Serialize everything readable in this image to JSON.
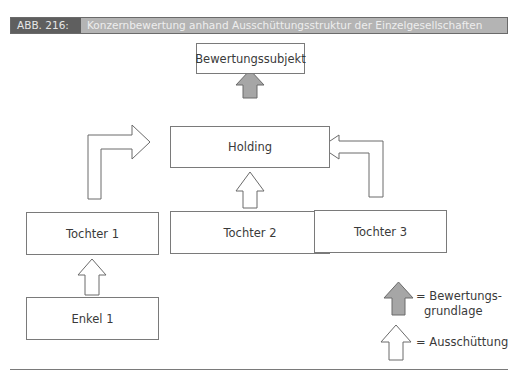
{
  "header": {
    "figure_number": "ABB. 216:",
    "title": "Konzernbewertung anhand Ausschüttungsstruktur der Einzelgesellschaften"
  },
  "nodes": {
    "subject": "Bewertungssubjekt",
    "holding": "Holding",
    "daughter1": "Tochter 1",
    "daughter2": "Tochter 2",
    "daughter3": "Tochter 3",
    "grandchild1": "Enkel 1"
  },
  "legend": {
    "valuation_basis": "= Bewertungs-\ngrundlage",
    "valuation_basis_line1": "= Bewertungs-",
    "valuation_basis_line2": "grundlage",
    "distribution": "= Ausschüttung"
  },
  "colors": {
    "header_dark": "#5f5f5f",
    "header_light": "#b4b4b4",
    "arrow_gray": "#a6a6a6",
    "border": "#7a7a7a"
  }
}
